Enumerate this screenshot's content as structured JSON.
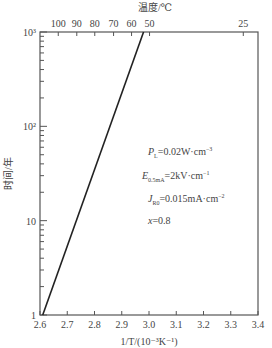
{
  "chart_data": {
    "type": "line",
    "title": "",
    "xlabel": "1/T/(10⁻³K⁻¹)",
    "ylabel": "时间/年",
    "top_xlabel": "温度/℃",
    "xlim": [
      2.6,
      3.4
    ],
    "ylim": [
      1,
      1000
    ],
    "yscale": "log",
    "x_ticks": [
      "2.6",
      "2.7",
      "2.8",
      "2.9",
      "3.0",
      "3.1",
      "3.2",
      "3.3",
      "3.4"
    ],
    "y_ticks": [
      "1",
      "10",
      "10²",
      "10³"
    ],
    "top_ticks": [
      {
        "label": "100",
        "x": 2.667
      },
      {
        "label": "90",
        "x": 2.735
      },
      {
        "label": "80",
        "x": 2.801
      },
      {
        "label": "70",
        "x": 2.87
      },
      {
        "label": "60",
        "x": 2.936
      },
      {
        "label": "50",
        "x": 3.002
      },
      {
        "label": "25",
        "x": 3.346
      }
    ],
    "series": [
      {
        "name": "lifetime",
        "x": [
          2.61,
          2.98
        ],
        "y": [
          1,
          1000
        ]
      }
    ],
    "annotations": [
      {
        "text": "P_L=0.02W·cm⁻³"
      },
      {
        "text": "E_0.5mA=2kV·cm⁻¹"
      },
      {
        "text": "J_R0=0.015mA·cm⁻²"
      },
      {
        "text": "x=0.8"
      }
    ],
    "grid": false,
    "legend": "none"
  },
  "labels": {
    "top_title": "温度/℃",
    "y_title": "时间/年",
    "x_title": "1/T/(10⁻³K⁻¹)",
    "ann_p_sym": "P",
    "ann_p_sub": "L",
    "ann_p_val": "=0.02W·cm",
    "ann_p_exp": "−3",
    "ann_e_sym": "E",
    "ann_e_sub": "0.5mA",
    "ann_e_val": "=2kV·cm",
    "ann_e_exp": "−1",
    "ann_j_sym": "J",
    "ann_j_sub": "R0",
    "ann_j_val": "=0.015mA·cm",
    "ann_j_exp": "−2",
    "ann_x_sym": "x",
    "ann_x_val": "=0.8"
  },
  "colors": {
    "axis": "#555555",
    "line": "#222222",
    "text": "#444444"
  }
}
